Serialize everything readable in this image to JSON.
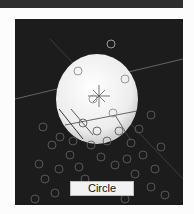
{
  "viewer": {
    "selection_label": "Circle",
    "colors": {
      "background": "#1c1c1c",
      "sphere": "#f0f0f0",
      "circles": "#6a6a6a",
      "lines": "#8a8a8a",
      "crosshair": "#555555"
    }
  }
}
